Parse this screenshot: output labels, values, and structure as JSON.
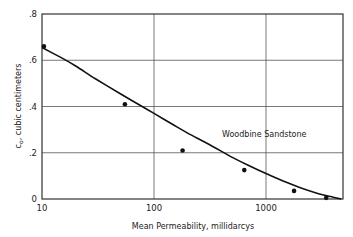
{
  "chart_data": {
    "type": "scatter",
    "title": "",
    "xlabel": "Mean Permeability, millidarcys",
    "ylabel_main": "c",
    "ylabel_sub": "o",
    "ylabel_rest": ", cubic centimeters",
    "ylabel": "c_o, cubic centimeters",
    "xscale": "log",
    "xlim": [
      10,
      4900
    ],
    "ylim": [
      0,
      0.8
    ],
    "grid": true,
    "x_ticks": [
      10,
      100,
      1000
    ],
    "x_tick_labels": [
      "10",
      "100",
      "1000"
    ],
    "y_ticks": [
      0,
      0.2,
      0.4,
      0.6,
      0.8
    ],
    "y_tick_labels": [
      "0",
      ".2",
      ".4",
      ".6",
      ".8"
    ],
    "annotation": "Woodbine Sandstone",
    "series": [
      {
        "name": "Measured",
        "kind": "points",
        "x": [
          10.4,
          55,
          180,
          640,
          1780,
          3450
        ],
        "y": [
          0.66,
          0.41,
          0.21,
          0.125,
          0.035,
          0.005
        ]
      },
      {
        "name": "Fitted curve",
        "kind": "line",
        "x": [
          10,
          15,
          20,
          30,
          50,
          75,
          100,
          150,
          200,
          300,
          500,
          700,
          1000,
          1500,
          2000,
          3000,
          4000,
          4700
        ],
        "y": [
          0.655,
          0.61,
          0.575,
          0.52,
          0.455,
          0.405,
          0.37,
          0.32,
          0.285,
          0.24,
          0.18,
          0.145,
          0.11,
          0.073,
          0.05,
          0.022,
          0.008,
          0.0
        ]
      }
    ]
  }
}
